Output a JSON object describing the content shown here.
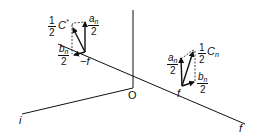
{
  "diagram": {
    "axes": {
      "origin_label": "O",
      "i_label": "i",
      "f_label": "f"
    },
    "left_group": {
      "position_label": "−f",
      "vector_label": {
        "coefficient": "1",
        "denominator": "2",
        "symbol": "C",
        "superscript": "*"
      },
      "vertical_component": {
        "numerator_sym": "a",
        "numerator_sub": "n",
        "denominator": "2"
      },
      "horizontal_component": {
        "numerator_sym": "b",
        "numerator_sub": "n",
        "denominator": "2"
      }
    },
    "right_group": {
      "position_label": "f",
      "vector_label": {
        "coefficient": "1",
        "denominator": "2",
        "symbol": "C",
        "subscript": "n"
      },
      "vertical_component": {
        "numerator_sym": "a",
        "numerator_sub": "n",
        "denominator": "2"
      },
      "horizontal_component": {
        "numerator_sym": "b",
        "numerator_sub": "n",
        "denominator": "2"
      }
    },
    "colors": {
      "ink": "#111111",
      "background": "#ffffff"
    }
  }
}
